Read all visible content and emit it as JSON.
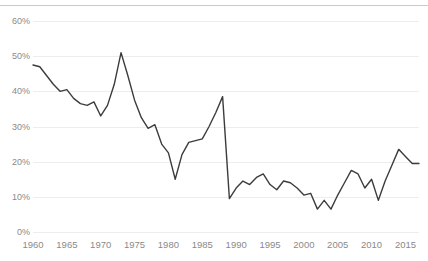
{
  "chart": {
    "title": "",
    "title_clipped": true
  },
  "chart_data": {
    "type": "line",
    "title": "",
    "subtitle": "",
    "xlabel": "",
    "ylabel": "",
    "xlim": [
      1960,
      2017
    ],
    "ylim": [
      0,
      60
    ],
    "ytick_step": 10,
    "ytick_format": "percent",
    "grid": "horizontal",
    "legend": "none",
    "line_color": "#3c3c3c",
    "line_width": 1.4,
    "grid_color": "#ededed",
    "text_color": "#8a8a8a",
    "background": "#ffffff",
    "yticks": [
      0,
      10,
      20,
      30,
      40,
      50,
      60
    ],
    "ytick_labels": [
      "0%",
      "10%",
      "20%",
      "30%",
      "40%",
      "50%",
      "60%"
    ],
    "xticks": [
      1960,
      1965,
      1970,
      1975,
      1980,
      1985,
      1990,
      1995,
      2000,
      2005,
      2010,
      2015
    ],
    "xtick_labels": [
      "1960",
      "1965",
      "1970",
      "1975",
      "1980",
      "1985",
      "1990",
      "1995",
      "2000",
      "2005",
      "2010",
      "2015"
    ],
    "x": [
      1960,
      1961,
      1962,
      1963,
      1964,
      1965,
      1966,
      1967,
      1968,
      1969,
      1970,
      1971,
      1972,
      1973,
      1974,
      1975,
      1976,
      1977,
      1978,
      1979,
      1980,
      1981,
      1982,
      1983,
      1984,
      1985,
      1986,
      1987,
      1988,
      1989,
      1990,
      1991,
      1992,
      1993,
      1994,
      1995,
      1996,
      1997,
      1998,
      1999,
      2000,
      2001,
      2002,
      2003,
      2004,
      2005,
      2006,
      2007,
      2008,
      2009,
      2010,
      2011,
      2012,
      2013,
      2014,
      2015,
      2016,
      2017
    ],
    "values": [
      47.5,
      47.0,
      44.5,
      42.0,
      40.0,
      40.5,
      38.0,
      36.5,
      36.0,
      37.0,
      33.0,
      36.0,
      42.0,
      51.0,
      44.5,
      37.5,
      32.5,
      29.5,
      30.5,
      25.0,
      22.5,
      15.0,
      22.0,
      25.5,
      26.0,
      26.5,
      30.0,
      34.0,
      38.5,
      9.5,
      12.5,
      14.5,
      13.5,
      15.5,
      16.5,
      13.5,
      12.0,
      14.5,
      14.0,
      12.5,
      10.5,
      11.0,
      6.5,
      9.0,
      6.5,
      10.5,
      14.0,
      17.5,
      16.5,
      12.5,
      15.0,
      9.0,
      14.5,
      19.0,
      23.5,
      21.5,
      19.5,
      19.5
    ],
    "series": [
      {
        "name": "series-1",
        "color": "#3c3c3c",
        "values": [
          47.5,
          47.0,
          44.5,
          42.0,
          40.0,
          40.5,
          38.0,
          36.5,
          36.0,
          37.0,
          33.0,
          36.0,
          42.0,
          51.0,
          44.5,
          37.5,
          32.5,
          29.5,
          30.5,
          25.0,
          22.5,
          15.0,
          22.0,
          25.5,
          26.0,
          26.5,
          30.0,
          34.0,
          38.5,
          9.5,
          12.5,
          14.5,
          13.5,
          15.5,
          16.5,
          13.5,
          12.0,
          14.5,
          14.0,
          12.5,
          10.5,
          11.0,
          6.5,
          9.0,
          6.5,
          10.5,
          14.0,
          17.5,
          16.5,
          12.5,
          15.0,
          9.0,
          14.5,
          19.0,
          23.5,
          21.5,
          19.5,
          19.5
        ]
      }
    ]
  }
}
